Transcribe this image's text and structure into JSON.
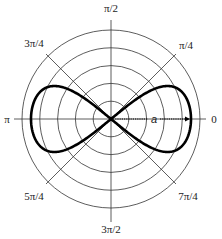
{
  "figure": {
    "type": "polar-diagram",
    "center": {
      "x": 111,
      "y": 119
    },
    "outer_radius": 89,
    "ring_count": 5,
    "colors": {
      "grid": "#333333",
      "curve": "#000000",
      "text": "#222222",
      "background": "#ffffff"
    }
  },
  "angle_labels": [
    {
      "id": "0",
      "text": "0",
      "x": 214,
      "y": 123,
      "anchor": "middle"
    },
    {
      "id": "pi4",
      "text": "π/4",
      "x": 186,
      "y": 49,
      "anchor": "middle"
    },
    {
      "id": "pi2",
      "text": "π/2",
      "x": 111,
      "y": 12,
      "anchor": "middle"
    },
    {
      "id": "3pi4",
      "text": "3π/4",
      "x": 34,
      "y": 47,
      "anchor": "middle"
    },
    {
      "id": "pi",
      "text": "π",
      "x": 7,
      "y": 123,
      "anchor": "middle"
    },
    {
      "id": "5pi4",
      "text": "5π/4",
      "x": 34,
      "y": 200,
      "anchor": "middle"
    },
    {
      "id": "3pi2",
      "text": "3π/2",
      "x": 111,
      "y": 233,
      "anchor": "middle"
    },
    {
      "id": "7pi4",
      "text": "7π/4",
      "x": 188,
      "y": 200,
      "anchor": "middle"
    }
  ],
  "annotation": {
    "parameter_label": "a",
    "arrow_from_x": 111,
    "arrow_to_x": 190
  },
  "curve": {
    "name": "lemniscate",
    "half_width_a": 80,
    "lobe_height": 33
  }
}
